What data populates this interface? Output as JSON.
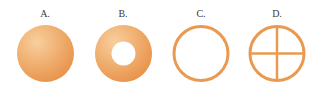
{
  "figures": [
    {
      "label": "A.",
      "shape": "solid-disk"
    },
    {
      "label": "B.",
      "shape": "annulus-disk"
    },
    {
      "label": "C.",
      "shape": "thin-ring"
    },
    {
      "label": "D.",
      "shape": "ring-with-cross"
    }
  ],
  "colors": {
    "fill_light": "#f6c48c",
    "fill_dark": "#e9964a",
    "stroke": "#ea9a50"
  }
}
